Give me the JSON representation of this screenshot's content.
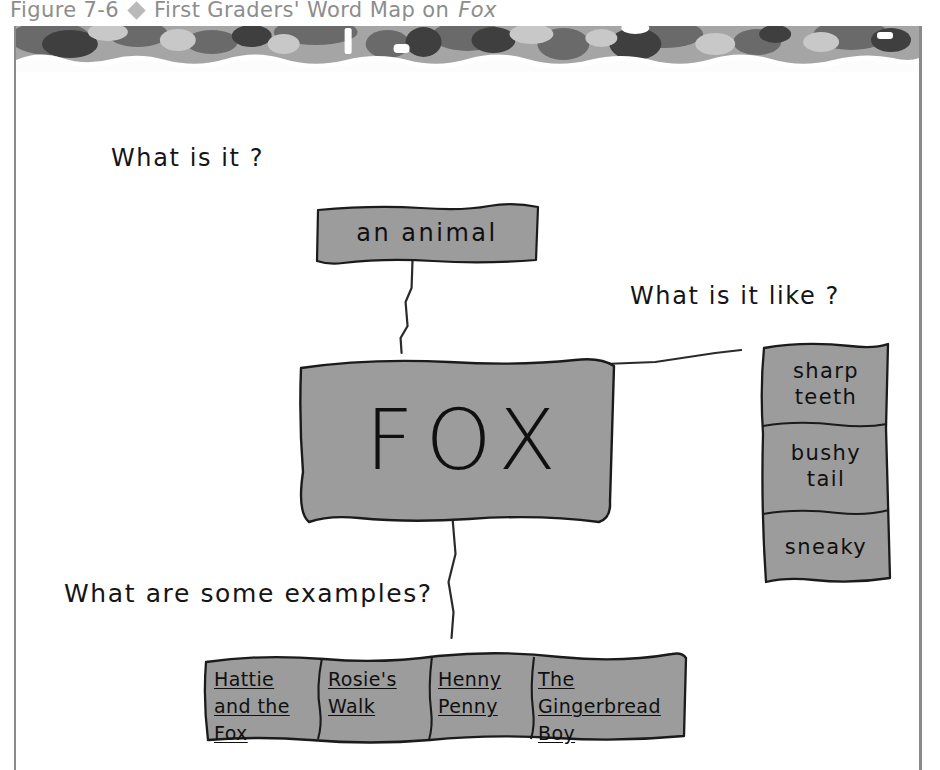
{
  "caption": {
    "number": "Figure 7-6",
    "diamond_icon": "diamond-bullet-icon",
    "title": "First Graders' Word Map on",
    "title_italic": "Fox"
  },
  "colors": {
    "box_fill": "#9c9c9c",
    "box_stroke": "#1b1b1b",
    "page_border": "#8a8a8a",
    "caption_text": "#8d8d8d",
    "band_dark": "#5e5e5e",
    "band_mid": "#8e8e8e",
    "band_light": "#c3c3c3"
  },
  "diagram": {
    "type": "word-map",
    "center": {
      "label": "FOX"
    },
    "prompts": {
      "what_is_it": "What is it ?",
      "what_is_it_like": "What is it like ?",
      "examples": "What are some examples?"
    },
    "definition": {
      "label": "an animal"
    },
    "attributes": [
      {
        "label": "sharp\nteeth"
      },
      {
        "label": "bushy\ntail"
      },
      {
        "label": "sneaky"
      }
    ],
    "examples": [
      {
        "lines": [
          "Hattie",
          "and the",
          "Fox"
        ]
      },
      {
        "lines": [
          "Rosie's",
          "Walk"
        ]
      },
      {
        "lines": [
          "Henny",
          "Penny"
        ]
      },
      {
        "lines": [
          "The",
          "Gingerbread",
          "Boy"
        ]
      }
    ]
  }
}
